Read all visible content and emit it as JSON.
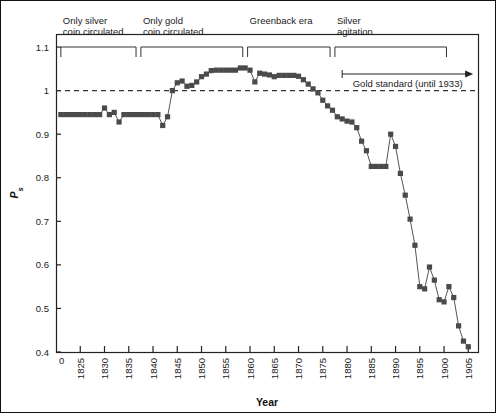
{
  "chart_data": {
    "type": "line",
    "title": "",
    "xlabel": "Year",
    "ylabel": "Ps",
    "ylabel_base": "P",
    "ylabel_sub": "s",
    "xlim": [
      1820,
      1907
    ],
    "ylim": [
      0.4,
      1.13
    ],
    "grid": false,
    "legend": "none",
    "marker": "square",
    "marker_color": "#4a4a4a",
    "line_color": "#555555",
    "reference_line": {
      "y": 1.0,
      "style": "dashed",
      "color": "#333333"
    },
    "xticks": [
      1825,
      1830,
      1835,
      1840,
      1845,
      1850,
      1855,
      1860,
      1865,
      1870,
      1875,
      1880,
      1885,
      1890,
      1895,
      1900,
      1905
    ],
    "xtick_labels": [
      "1825",
      "1830",
      "1835",
      "1840",
      "1845",
      "1850",
      "1855",
      "1860",
      "1865",
      "1870",
      "1875",
      "1880",
      "1885",
      "1890",
      "1895",
      "1900",
      "1905"
    ],
    "x_origin_label": "0",
    "yticks": [
      0.4,
      0.5,
      0.6,
      0.7,
      0.8,
      0.9,
      1.0,
      1.1
    ],
    "ytick_labels": [
      "0.4",
      "0.5",
      "0.6",
      "0.7",
      "0.8",
      "0.9",
      "1",
      "1.1"
    ],
    "x": [
      1821,
      1822,
      1823,
      1824,
      1825,
      1826,
      1827,
      1828,
      1829,
      1830,
      1831,
      1832,
      1833,
      1834,
      1835,
      1836,
      1837,
      1838,
      1839,
      1840,
      1841,
      1842,
      1843,
      1844,
      1845,
      1846,
      1847,
      1848,
      1849,
      1850,
      1851,
      1852,
      1853,
      1854,
      1855,
      1856,
      1857,
      1858,
      1859,
      1860,
      1861,
      1862,
      1863,
      1864,
      1865,
      1866,
      1867,
      1868,
      1869,
      1870,
      1871,
      1872,
      1873,
      1874,
      1875,
      1876,
      1877,
      1878,
      1879,
      1880,
      1881,
      1882,
      1883,
      1884,
      1885,
      1886,
      1887,
      1888,
      1889,
      1890,
      1891,
      1892,
      1893,
      1894,
      1895,
      1896,
      1897,
      1898,
      1899,
      1900,
      1901,
      1902,
      1903,
      1904,
      1905
    ],
    "y": [
      0.945,
      0.945,
      0.945,
      0.945,
      0.945,
      0.945,
      0.945,
      0.945,
      0.945,
      0.96,
      0.945,
      0.95,
      0.928,
      0.945,
      0.945,
      0.945,
      0.945,
      0.945,
      0.945,
      0.945,
      0.945,
      0.92,
      0.94,
      1.0,
      1.018,
      1.022,
      1.01,
      1.012,
      1.02,
      1.032,
      1.038,
      1.046,
      1.047,
      1.047,
      1.047,
      1.047,
      1.047,
      1.052,
      1.052,
      1.047,
      1.02,
      1.04,
      1.038,
      1.036,
      1.032,
      1.035,
      1.035,
      1.035,
      1.035,
      1.033,
      1.025,
      1.015,
      1.004,
      0.995,
      0.978,
      0.965,
      0.955,
      0.94,
      0.935,
      0.93,
      0.928,
      0.915,
      0.884,
      0.862,
      0.826,
      0.826,
      0.826,
      0.826,
      0.9,
      0.872,
      0.81,
      0.76,
      0.705,
      0.645,
      0.55,
      0.545,
      0.595,
      0.565,
      0.52,
      0.515,
      0.55,
      0.525,
      0.46,
      0.425,
      0.412,
      0.43,
      0.45,
      0.51
    ],
    "series_note": "silver price ratio Ps by year",
    "annotations": [
      {
        "label_line1": "Only silver",
        "label_line2": "coin circulated",
        "bracket_start": 1821,
        "bracket_end": 1836.5
      },
      {
        "label_line1": "Only gold",
        "label_line2": "coin circulated",
        "bracket_start": 1837.5,
        "bracket_end": 1858.5
      },
      {
        "label_line1": "Greenback era",
        "label_line2": "",
        "bracket_start": 1859.5,
        "bracket_end": 1876.5
      },
      {
        "label_line1": "Silver",
        "label_line2": "agitation",
        "bracket_start": 1877.5,
        "bracket_end": 1900.5
      }
    ],
    "arrow_annotation": {
      "label": "Gold standard (until 1933)",
      "start": 1879,
      "end": 1906
    }
  }
}
